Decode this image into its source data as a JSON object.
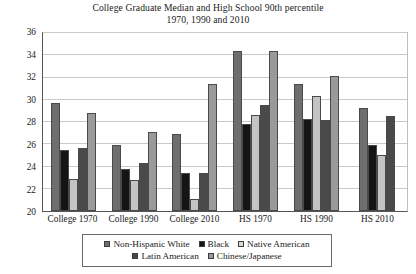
{
  "chart_data": {
    "type": "bar",
    "title": "College Graduate Median and High School 90th percentile",
    "subtitle": "1970, 1990 and 2010",
    "xlabel": "",
    "ylabel": "US dollars in 2009",
    "ylim": [
      20,
      36
    ],
    "ytick_step": 2,
    "yticks": [
      20,
      22,
      24,
      26,
      28,
      30,
      32,
      34,
      36
    ],
    "grid": true,
    "legend_position": "bottom",
    "categories": [
      "College 1970",
      "College 1990",
      "College 2010",
      "HS 1970",
      "HS 1990",
      "HS 2010"
    ],
    "series": [
      {
        "name": "Non-Hispanic White",
        "color": "#6e6e6e",
        "values": [
          29.7,
          25.9,
          26.9,
          34.4,
          31.4,
          29.3
        ]
      },
      {
        "name": "Black",
        "color": "#141414",
        "values": [
          25.5,
          23.8,
          23.4,
          27.8,
          28.3,
          25.9
        ]
      },
      {
        "name": "Native American",
        "color": "#c4c4c4",
        "values": [
          22.9,
          22.8,
          21.1,
          28.6,
          30.35,
          25.0
        ]
      },
      {
        "name": "Latin American",
        "color": "#4a4a4a",
        "values": [
          25.7,
          24.3,
          23.4,
          29.5,
          28.2,
          28.5
        ]
      },
      {
        "name": "Chinese/Japanese",
        "color": "#9a9a9a",
        "values": [
          28.8,
          27.1,
          31.4,
          34.4,
          32.1,
          null
        ]
      }
    ]
  },
  "legend": {
    "row1": [
      {
        "label": "Non-Hispanic White",
        "color": "#6e6e6e"
      },
      {
        "label": "Black",
        "color": "#141414"
      },
      {
        "label": "Native American",
        "color": "#d8d8d8"
      }
    ],
    "row2": [
      {
        "label": "Latin American",
        "color": "#4a4a4a"
      },
      {
        "label": "Chinese/Japanese",
        "color": "#9a9a9a"
      }
    ]
  }
}
